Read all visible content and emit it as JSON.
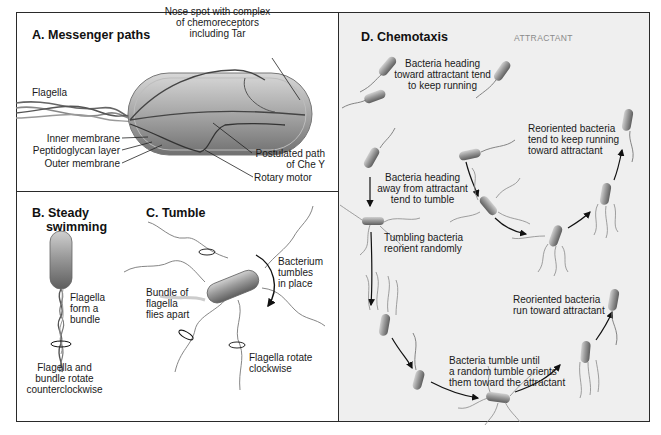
{
  "figure": {
    "colors": {
      "border": "#2a2a2a",
      "panel_d_background": "#efefef",
      "bacterium_fill": "#8f8f8f",
      "bacterium_highlight": "#c9c9c9",
      "label_gray": "#8a8a8a"
    },
    "panels": {
      "a": {
        "title": "A. Messenger paths",
        "labels": {
          "nose_spot": "Nose spot with complex\nof chemoreceptors\nincluding Tar",
          "flagella": "Flagella",
          "inner_membrane": "Inner membrane",
          "peptidoglycan": "Peptidoglycan layer",
          "outer_membrane": "Outer membrane",
          "postulated_path": "Postulated path\nof Che Y",
          "rotary_motor": "Rotary motor"
        }
      },
      "b": {
        "title": "B. Steady\n    swimming",
        "labels": {
          "bundle": "Flagella\nform a\nbundle",
          "rotation": "Flagella and\nbundle rotate\ncounterclockwise"
        }
      },
      "c": {
        "title": "C. Tumble",
        "labels": {
          "tumbles": "Bacterium\ntumbles\nin place",
          "flies_apart": "Bundle of\nflagella\nflies apart",
          "clockwise": "Flagella rotate\nclockwise"
        }
      },
      "d": {
        "title": "D. Chemotaxis",
        "attractant_label": "ATTRACTANT",
        "labels": {
          "toward": "Bacteria heading\ntoward attractant tend\nto keep running",
          "away": "Bacteria heading\naway from attractant\ntend to tumble",
          "tumbling": "Tumbling bacteria\nreorient randomly",
          "reoriented_keep": "Reoriented bacteria\ntend to keep running\ntoward attractant",
          "reoriented_run": "Reoriented bacteria\nrun toward attractant",
          "tumble_until": "Bacteria tumble until\na random tumble orients\nthem toward the attractant"
        }
      }
    }
  }
}
